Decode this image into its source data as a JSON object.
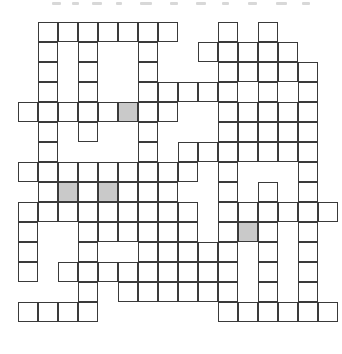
{
  "document": {
    "type": "crossword-grid",
    "title": "Crossword puzzle grid",
    "columns": 16,
    "rows": 16,
    "cell_size_px": 20,
    "origin_x_px": 18,
    "origin_y_px": 22
  },
  "colors": {
    "background": "#ffffff",
    "cell_fill": "#ffffff",
    "cell_border": "#3a3a3a",
    "shaded_fill": "#c9c9c9"
  },
  "legend": {
    "white_cell": "open answer square",
    "shaded_cell": "highlighted key square"
  },
  "grid": {
    "shaded_cells": [
      {
        "row": 4,
        "col": 5
      },
      {
        "row": 8,
        "col": 2
      },
      {
        "row": 8,
        "col": 4
      },
      {
        "row": 10,
        "col": 11
      }
    ],
    "rows": [
      {
        "row": 0,
        "filled": [
          1,
          2,
          3,
          4,
          5,
          6,
          7,
          10,
          12
        ]
      },
      {
        "row": 1,
        "filled": [
          1,
          3,
          6,
          9,
          10,
          11,
          12,
          13
        ]
      },
      {
        "row": 2,
        "filled": [
          1,
          3,
          6,
          10,
          11,
          12,
          13,
          14
        ]
      },
      {
        "row": 3,
        "filled": [
          1,
          3,
          6,
          7,
          8,
          9,
          10,
          12,
          14
        ]
      },
      {
        "row": 4,
        "filled": [
          0,
          1,
          2,
          3,
          4,
          5,
          6,
          7,
          10,
          11,
          12,
          13,
          14
        ]
      },
      {
        "row": 5,
        "filled": [
          1,
          3,
          6,
          10,
          11,
          12,
          13,
          14
        ]
      },
      {
        "row": 6,
        "filled": [
          1,
          6,
          8,
          9,
          10,
          11,
          12,
          13,
          14
        ]
      },
      {
        "row": 7,
        "filled": [
          0,
          1,
          2,
          3,
          4,
          5,
          6,
          7,
          8,
          10,
          14
        ]
      },
      {
        "row": 8,
        "filled": [
          1,
          2,
          3,
          4,
          5,
          6,
          7,
          10,
          12,
          14
        ]
      },
      {
        "row": 9,
        "filled": [
          0,
          1,
          2,
          3,
          4,
          5,
          6,
          7,
          8,
          10,
          11,
          12,
          13,
          14,
          15
        ]
      },
      {
        "row": 10,
        "filled": [
          0,
          3,
          4,
          5,
          6,
          7,
          8,
          10,
          11,
          12,
          14
        ]
      },
      {
        "row": 11,
        "filled": [
          0,
          3,
          6,
          7,
          8,
          9,
          10,
          12,
          14
        ]
      },
      {
        "row": 12,
        "filled": [
          0,
          2,
          3,
          4,
          5,
          6,
          7,
          8,
          9,
          10,
          12,
          14
        ]
      },
      {
        "row": 13,
        "filled": [
          3,
          5,
          6,
          7,
          8,
          9,
          10,
          12,
          14
        ]
      },
      {
        "row": 14,
        "filled": [
          0,
          1,
          2,
          3,
          10,
          11,
          12,
          13,
          14,
          15
        ]
      },
      {
        "row": 15,
        "filled": []
      }
    ],
    "counts": {
      "total_cells": 156,
      "shaded_count": 4
    }
  },
  "artifacts": {
    "top_scan_marks": [
      {
        "x": 52,
        "width": 9
      },
      {
        "x": 72,
        "width": 7
      },
      {
        "x": 92,
        "width": 10
      },
      {
        "x": 116,
        "width": 6
      },
      {
        "x": 140,
        "width": 12
      },
      {
        "x": 170,
        "width": 8
      },
      {
        "x": 196,
        "width": 10
      },
      {
        "x": 222,
        "width": 7
      },
      {
        "x": 248,
        "width": 9
      },
      {
        "x": 276,
        "width": 11
      },
      {
        "x": 302,
        "width": 8
      }
    ]
  }
}
